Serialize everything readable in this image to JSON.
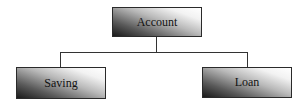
{
  "diagram": {
    "type": "hierarchy",
    "root": {
      "label": "Account"
    },
    "children": [
      {
        "label": "Saving"
      },
      {
        "label": "Loan"
      }
    ],
    "colors": {
      "box_dark": "#1a1a1a",
      "box_light": "#ffffff",
      "line": "#333333",
      "border": "#2a2a2a"
    }
  }
}
